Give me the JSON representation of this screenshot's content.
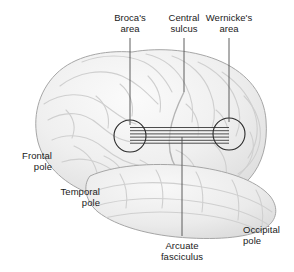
{
  "figure": {
    "width": 294,
    "height": 272,
    "background_color": "#ffffff"
  },
  "colors": {
    "background": "#ffffff",
    "brain_fill": "#ededed",
    "brain_fill_light": "#f7f7f7",
    "brain_outline": "#9a9a9a",
    "sulci": "#c8c8c8",
    "leader_line": "#4d4d4d",
    "circle_outline": "#2b2b2b",
    "tract_line": "#3a3a3a",
    "text": "#1a1a1a"
  },
  "labels": [
    {
      "id": "brocas-area",
      "line1": "Broca's",
      "line2": "area",
      "align": "center",
      "x": 130,
      "y": 12,
      "leader": {
        "x1": 130,
        "y1": 38,
        "x2": 130,
        "y2": 125
      }
    },
    {
      "id": "central-sulcus",
      "line1": "Central",
      "line2": "sulcus",
      "align": "center",
      "x": 184,
      "y": 12,
      "leader": {
        "x1": 184,
        "y1": 38,
        "x2": 184,
        "y2": 92
      }
    },
    {
      "id": "wernickes-area",
      "line1": "Wernicke's",
      "line2": "area",
      "align": "center",
      "x": 229,
      "y": 12,
      "leader": {
        "x1": 229,
        "y1": 38,
        "x2": 229,
        "y2": 122
      }
    },
    {
      "id": "frontal-pole",
      "line1": "Frontal",
      "line2": "pole",
      "align": "right",
      "x": 52,
      "y": 150,
      "leader": null
    },
    {
      "id": "temporal-pole",
      "line1": "Temporal",
      "line2": "pole",
      "align": "right",
      "x": 100,
      "y": 186,
      "leader": null
    },
    {
      "id": "occipital-pole",
      "line1": "Occipital",
      "line2": "pole",
      "align": "left",
      "x": 243,
      "y": 224,
      "leader": null
    },
    {
      "id": "arcuate-fasciculus",
      "line1": "Arcuate",
      "line2": "fasciculus",
      "align": "center",
      "x": 182,
      "y": 240,
      "leader": {
        "x1": 182,
        "y1": 137,
        "x2": 182,
        "y2": 236
      }
    }
  ],
  "structures": {
    "brocas_circle": {
      "cx": 130,
      "cy": 136,
      "r": 16
    },
    "wernickes_circle": {
      "cx": 229,
      "cy": 134,
      "r": 16
    },
    "arcuate_tract": {
      "x_start": 130,
      "x_end": 229,
      "y_top": 127,
      "y_bottom": 143,
      "line_count": 6,
      "description": "Striped band connecting Broca's area and Wernicke's area"
    }
  }
}
